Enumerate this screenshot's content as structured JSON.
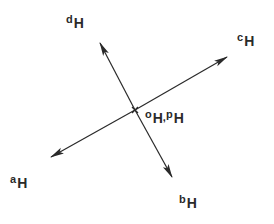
{
  "diagram": {
    "type": "vector-diagram",
    "center": {
      "x": 135,
      "y": 110
    },
    "stroke_color": "#2a2a2a",
    "background": "#ffffff",
    "arrows": [
      {
        "id": "a",
        "from": [
          135,
          110
        ],
        "to": [
          51,
          157
        ]
      },
      {
        "id": "b",
        "from": [
          135,
          110
        ],
        "to": [
          172,
          177
        ]
      },
      {
        "id": "c",
        "from": [
          135,
          110
        ],
        "to": [
          227,
          57
        ]
      },
      {
        "id": "d",
        "from": [
          135,
          110
        ],
        "to": [
          100,
          43
        ]
      }
    ],
    "labels": {
      "a": {
        "base": "a",
        "sub": "H"
      },
      "b": {
        "base": "b",
        "sub": "H"
      },
      "c": {
        "base": "c",
        "sub": "H"
      },
      "d": {
        "base": "d",
        "sub": "H"
      },
      "origin": {
        "base1": "o",
        "sub1": "H",
        "sep": ",",
        "base2": "p",
        "sub2": "H"
      }
    }
  }
}
